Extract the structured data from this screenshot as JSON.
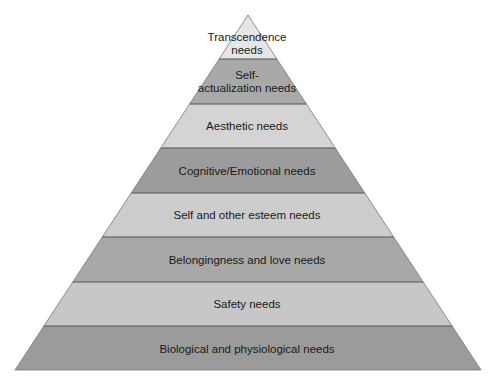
{
  "diagram": {
    "type": "pyramid",
    "title": "",
    "apex": [
      248,
      15
    ],
    "base_left": [
      15,
      370
    ],
    "base_right": [
      481,
      370
    ],
    "divider_color": "#555555",
    "levels_top_to_bottom": [
      {
        "label_line1": "Transcendence",
        "label_line2": "needs",
        "fill": "#e6e6e6",
        "y_top": 15,
        "y_bottom": 59
      },
      {
        "label_line1": "Self-",
        "label_line2": "actualization needs",
        "fill": "#a9a9a9",
        "y_top": 59,
        "y_bottom": 104
      },
      {
        "label_line1": "Aesthetic needs",
        "label_line2": "",
        "fill": "#d4d4d4",
        "y_top": 104,
        "y_bottom": 148
      },
      {
        "label_line1": "Cognitive/Emotional needs",
        "label_line2": "",
        "fill": "#9c9c9c",
        "y_top": 148,
        "y_bottom": 193
      },
      {
        "label_line1": "Self and other esteem needs",
        "label_line2": "",
        "fill": "#cdcdcd",
        "y_top": 193,
        "y_bottom": 237
      },
      {
        "label_line1": "Belongingness and love needs",
        "label_line2": "",
        "fill": "#a8a8a8",
        "y_top": 237,
        "y_bottom": 282
      },
      {
        "label_line1": "Safety needs",
        "label_line2": "",
        "fill": "#c7c7c7",
        "y_top": 282,
        "y_bottom": 326
      },
      {
        "label_line1": "Biological and physiological needs",
        "label_line2": "",
        "fill": "#9b9b9b",
        "y_top": 326,
        "y_bottom": 370
      }
    ]
  }
}
